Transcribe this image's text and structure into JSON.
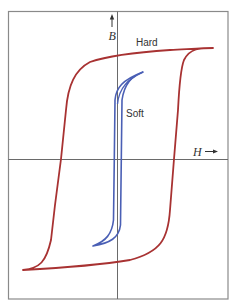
{
  "figure": {
    "type": "hysteresis-loop-diagram",
    "axes": {
      "y_label": "B",
      "x_label": "H",
      "y_arrow": "↑",
      "x_arrow": "→"
    },
    "curves": [
      {
        "name": "Hard",
        "label": "Hard",
        "color": "#a83232"
      },
      {
        "name": "Soft",
        "label": "Soft",
        "color": "#4a5fb5"
      }
    ],
    "colors": {
      "frame": "#8a8a8a",
      "axis": "#6a6a6a",
      "hard": "#a83232",
      "soft": "#4a5fb5",
      "text": "#333333"
    }
  }
}
